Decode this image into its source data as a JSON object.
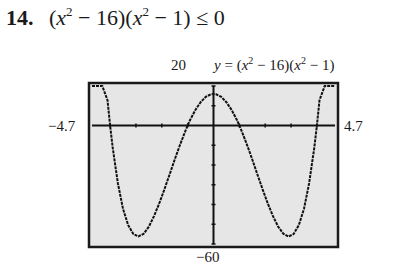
{
  "problem": {
    "number": "14.",
    "parts": [
      "(",
      "x",
      "2",
      " − 16)(",
      "x",
      "2",
      " − 1) ≤ 0"
    ]
  },
  "graph": {
    "ymax_label": "20",
    "ymin_label": "−60",
    "xmin_label": "−4.7",
    "xmax_label": "4.7",
    "equation_parts": [
      "y",
      " = (",
      "x",
      "2",
      " − 16)(",
      "x",
      "2",
      " − 1)"
    ],
    "screen_color": "#e6e6e6",
    "curve_color": "#111111"
  },
  "chart_data": {
    "type": "line",
    "xlabel": "",
    "ylabel": "",
    "xlim": [
      -4.7,
      4.7
    ],
    "ylim": [
      -60,
      20
    ],
    "xscale": 1,
    "yscale": 10,
    "grid": false,
    "series": [
      {
        "name": "y = (x^2 − 16)(x^2 − 1)",
        "x": [
          -4.7,
          -4.5,
          -4.3,
          -4.1,
          -4.0,
          -3.9,
          -3.7,
          -3.5,
          -3.3,
          -3.1,
          -2.9,
          -2.7,
          -2.5,
          -2.3,
          -2.1,
          -1.9,
          -1.7,
          -1.5,
          -1.3,
          -1.1,
          -1.0,
          -0.9,
          -0.7,
          -0.5,
          -0.3,
          -0.1,
          0,
          0.1,
          0.3,
          0.5,
          0.7,
          0.9,
          1.0,
          1.1,
          1.3,
          1.5,
          1.7,
          1.9,
          2.1,
          2.3,
          2.5,
          2.7,
          2.9,
          3.1,
          3.3,
          3.5,
          3.7,
          3.9,
          4.0,
          4.1,
          4.3,
          4.5,
          4.7
        ],
        "y": [
          128.4,
          81.8,
          43.6,
          12.8,
          0,
          -11.2,
          -29.3,
          -42.2,
          -50.5,
          -55.0,
          -56.2,
          -54.8,
          -51.2,
          -45.9,
          -39.5,
          -32.3,
          -24.8,
          -17.2,
          -9.9,
          -3.1,
          0,
          2.9,
          7.9,
          11.8,
          14.5,
          15.8,
          16,
          15.8,
          14.5,
          11.8,
          7.9,
          2.9,
          0,
          -3.1,
          -9.9,
          -17.2,
          -24.8,
          -32.3,
          -39.5,
          -45.9,
          -51.2,
          -54.8,
          -56.2,
          -55.0,
          -50.5,
          -42.2,
          -29.3,
          -11.2,
          0,
          12.8,
          43.6,
          81.8,
          128.4
        ]
      }
    ]
  }
}
